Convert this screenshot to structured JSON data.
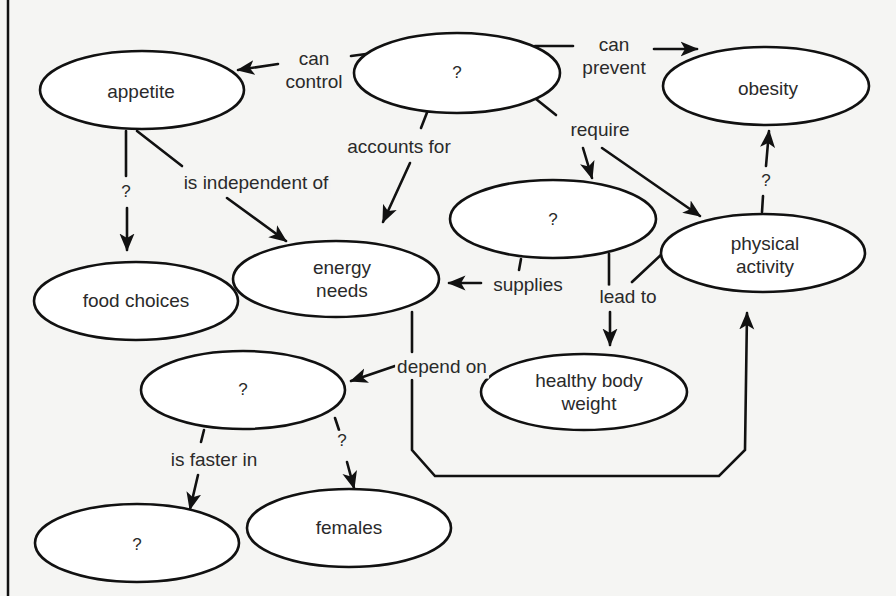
{
  "diagram": {
    "type": "concept-map",
    "nodes": [
      {
        "id": "n_top",
        "label": "?"
      },
      {
        "id": "n_appetite",
        "label": "appetite"
      },
      {
        "id": "n_obesity",
        "label": "obesity"
      },
      {
        "id": "n_mid",
        "label": "?"
      },
      {
        "id": "n_physical",
        "line1": "physical",
        "line2": "activity"
      },
      {
        "id": "n_food",
        "label": "food choices"
      },
      {
        "id": "n_energy",
        "line1": "energy",
        "line2": "needs"
      },
      {
        "id": "n_healthy",
        "line1": "healthy body",
        "line2": "weight"
      },
      {
        "id": "n_lower",
        "label": "?"
      },
      {
        "id": "n_bottom",
        "label": "?"
      },
      {
        "id": "n_females",
        "label": "females"
      }
    ],
    "links": [
      {
        "id": "l_can_control",
        "line1": "can",
        "line2": "control",
        "from": "n_top",
        "to": "n_appetite"
      },
      {
        "id": "l_can_prevent",
        "line1": "can",
        "line2": "prevent",
        "from": "n_top",
        "to": "n_obesity"
      },
      {
        "id": "l_accounts_for",
        "label": "accounts for",
        "from": "n_top",
        "to": "n_energy"
      },
      {
        "id": "l_require",
        "label": "require",
        "from": "n_top",
        "to": [
          "n_mid",
          "n_physical"
        ]
      },
      {
        "id": "l_appetite_q",
        "label": "?",
        "from": "n_appetite",
        "to": "n_food"
      },
      {
        "id": "l_independent",
        "label": "is independent of",
        "from": "n_appetite",
        "to": "n_energy"
      },
      {
        "id": "l_physical_q",
        "label": "?",
        "from": "n_physical",
        "to": "n_obesity"
      },
      {
        "id": "l_supplies",
        "label": "supplies",
        "from": "n_mid",
        "to": "n_energy"
      },
      {
        "id": "l_lead_to",
        "label": "lead to",
        "from": [
          "n_mid",
          "n_physical"
        ],
        "to": "n_healthy"
      },
      {
        "id": "l_depend_on",
        "label": "depend on",
        "from": "n_energy",
        "to": [
          "n_lower",
          "n_physical"
        ]
      },
      {
        "id": "l_faster_in",
        "label": "is faster in",
        "from": "n_lower",
        "to": "n_bottom"
      },
      {
        "id": "l_lower_q",
        "label": "?",
        "from": "n_lower",
        "to": "n_females"
      }
    ]
  }
}
